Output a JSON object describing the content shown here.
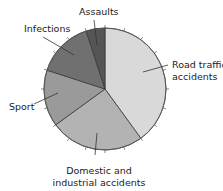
{
  "chart_data": {
    "type": "pie",
    "title": "",
    "categories": [
      "Road traffic accidents",
      "Domestic and industrial accidents",
      "Sport",
      "Infections",
      "Assaults"
    ],
    "values": [
      40,
      25,
      15,
      15,
      5
    ],
    "unit": "%",
    "colors": [
      "#d9d9d9",
      "#b3b3b3",
      "#9a9a9a",
      "#707070",
      "#555555"
    ],
    "start_angle_deg": 0,
    "direction": "clockwise",
    "legend": "none (callout labels)",
    "labels": {
      "road": [
        "Road traffic",
        "accidents"
      ],
      "domestic": [
        "Domestic and",
        "industrial accidents"
      ],
      "sport": [
        "Sport"
      ],
      "infections": [
        "Infections"
      ],
      "assaults": [
        "Assaults"
      ]
    },
    "tick_marks_around_rim": true
  }
}
